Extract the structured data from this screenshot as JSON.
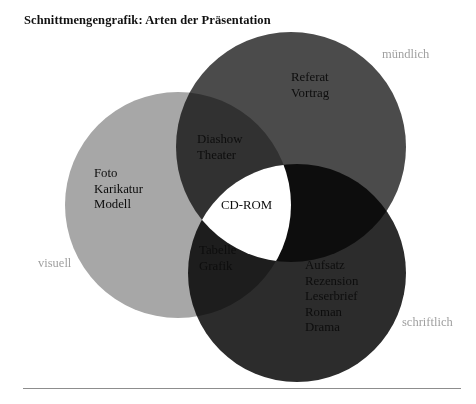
{
  "page": {
    "title": "Schnittmengengrafik: Arten der Präsentation",
    "background_color": "#ffffff",
    "rule_color": "#8d8d8d"
  },
  "diagram": {
    "type": "venn3",
    "outer_label_color": "#a0a0a0",
    "intersection_center_fill": "#ffffff",
    "sets": [
      {
        "id": "visuell",
        "outer_label": "visuell",
        "color": "#a7a7a7",
        "cx": 178,
        "cy": 205,
        "r": 113,
        "items": [
          "Foto",
          "Karikatur",
          "Modell"
        ]
      },
      {
        "id": "muendlich",
        "outer_label": "mündlich",
        "color": "#4b4b4b",
        "cx": 291,
        "cy": 147,
        "r": 115,
        "items": [
          "Referat",
          "Vortrag"
        ]
      },
      {
        "id": "schriftlich",
        "outer_label": "schriftlich",
        "color": "#2c2c2c",
        "cx": 297,
        "cy": 273,
        "r": 109,
        "items": [
          "Aufsatz",
          "Rezension",
          "Leserbrief",
          "Roman",
          "Drama"
        ]
      }
    ],
    "intersections": [
      {
        "id": "visuell-muendlich",
        "sets": [
          "visuell",
          "muendlich"
        ],
        "items": [
          "Diashow",
          "Theater"
        ]
      },
      {
        "id": "visuell-schriftlich",
        "sets": [
          "visuell",
          "schriftlich"
        ],
        "items": [
          "Tabelle",
          "Grafik"
        ]
      },
      {
        "id": "visuell-muendlich-schriftlich",
        "sets": [
          "visuell",
          "muendlich",
          "schriftlich"
        ],
        "items": [
          "CD-ROM"
        ]
      }
    ]
  },
  "text": {
    "muendlich_items": "Referat\nVortrag",
    "visuell_items": "Foto\nKarikatur\nModell",
    "schriftlich_items": "Aufsatz\nRezension\nLeserbrief\nRoman\nDrama",
    "diashow_items": "Diashow\nTheater",
    "tabelle_items": "Tabelle\nGrafik",
    "cdrom_item": "CD-ROM"
  }
}
